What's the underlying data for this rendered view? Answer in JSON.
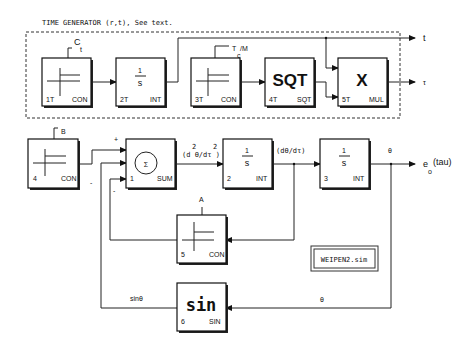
{
  "diagram": {
    "title": "TIME GENERATOR (r,t), See text.",
    "file_label": "WEIPEN2.sim",
    "signals": {
      "t_out": "t",
      "tau_out": "τ",
      "output": "e",
      "output_sub": "o",
      "output_arg": "(tau)",
      "ct_main": "C",
      "ct_sub": "t",
      "tcm_main": "T",
      "tcm_sub": "c",
      "tcm_tail": "/M",
      "B": "B",
      "A": "A",
      "plus": "+",
      "minus1": "-",
      "minus2": "-",
      "d2": "(d θ/dτ )",
      "d2_sup1": "2",
      "d2_sup2": "2",
      "d1": "(dθ/dτ)",
      "theta1": "θ",
      "theta2": "θ",
      "sin_theta": "sinθ"
    },
    "blocks": [
      {
        "id": "1T",
        "type": "CON",
        "symbol": "step"
      },
      {
        "id": "2T",
        "type": "INT",
        "symbol_num": "1",
        "symbol_den": "s"
      },
      {
        "id": "3T",
        "type": "CON",
        "symbol": "step"
      },
      {
        "id": "4T",
        "type": "SQT",
        "symbol": "SQT"
      },
      {
        "id": "5T",
        "type": "MUL",
        "symbol": "X"
      },
      {
        "id": "4",
        "type": "CON",
        "symbol": "step"
      },
      {
        "id": "1",
        "type": "SUM",
        "symbol": "Σ"
      },
      {
        "id": "2",
        "type": "INT",
        "symbol_num": "1",
        "symbol_den": "s"
      },
      {
        "id": "3",
        "type": "INT",
        "symbol_num": "1",
        "symbol_den": "s"
      },
      {
        "id": "5",
        "type": "CON",
        "symbol": "step"
      },
      {
        "id": "6",
        "type": "SIN",
        "symbol": "sin"
      }
    ]
  }
}
